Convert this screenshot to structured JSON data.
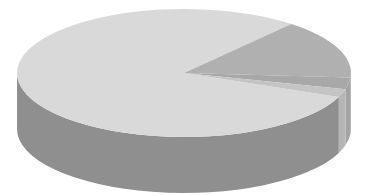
{
  "chart_data": {
    "type": "pie",
    "style": "3d",
    "title": "",
    "categories": [
      "Slice A",
      "Slice B",
      "Slice C",
      "Slice D"
    ],
    "values": [
      80,
      15,
      3,
      2
    ],
    "colors": {
      "top": [
        "#d9d9d9",
        "#b0b0b0",
        "#a8a8a8",
        "#c4c4c4"
      ],
      "side": [
        "#8f8f8f",
        "#999999",
        "#a3a3a3",
        "#b5b5b5"
      ]
    },
    "legend": null,
    "labels_visible": false
  },
  "geometry": {
    "cx": 184,
    "cy": 73,
    "rx": 167,
    "ry": 64,
    "depth": 56,
    "start_angle_deg": 22
  }
}
